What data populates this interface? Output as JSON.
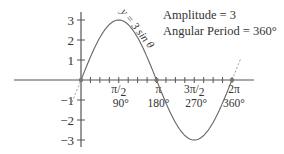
{
  "chart_data": {
    "type": "line",
    "title": "",
    "function_label": "y = 3 sin θ",
    "annotations": [
      "Amplitude = 3",
      "Angular Period = 360°"
    ],
    "xlabel": "",
    "ylabel": "",
    "xlim_radians": [
      -1.45,
      6.55
    ],
    "ylim": [
      -3.3,
      3.3
    ],
    "y_ticks": [
      {
        "value": 3,
        "label": "3"
      },
      {
        "value": 2,
        "label": "2"
      },
      {
        "value": 1,
        "label": "1"
      },
      {
        "value": -1,
        "label": "-1"
      },
      {
        "value": -2,
        "label": "-2"
      },
      {
        "value": -3,
        "label": "-3"
      }
    ],
    "x_ticks": [
      {
        "value_pi": 0.5,
        "label": "π/2",
        "degrees": "90°"
      },
      {
        "value_pi": 1.0,
        "label": "π",
        "degrees": "180°"
      },
      {
        "value_pi": 1.5,
        "label": "3π/2",
        "degrees": "270°"
      },
      {
        "value_pi": 2.0,
        "label": "2π",
        "degrees": "360°"
      }
    ],
    "minor_tick_step_pi": 0.125,
    "series": [
      {
        "name": "y = 3 sin θ",
        "amplitude": 3,
        "domain_pi": [
          0,
          2
        ],
        "extension_pi_dashed": [
          [
            -0.12,
            0
          ],
          [
            2,
            2.12
          ]
        ],
        "marked_points_pi": [
          0,
          1,
          2
        ]
      }
    ],
    "colors": {
      "axis": "#555555",
      "curve": "#666666",
      "text": "#333333",
      "point": "#777777"
    }
  }
}
